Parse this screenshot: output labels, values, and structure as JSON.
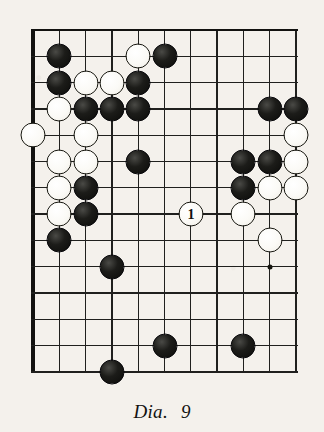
{
  "figure": {
    "caption_label": "Dia.",
    "caption_number": "9",
    "kind": "go-board-diagram"
  },
  "board": {
    "columns": 11,
    "rows": 14,
    "origin_x": 33,
    "origin_y": 30,
    "spacing": 26.3,
    "edge_left": true,
    "edge_top": true,
    "line_color": "#20201e",
    "border_color": "#121210",
    "background": "#f4f1ec",
    "star_points": [
      {
        "col": 9,
        "row": 9,
        "name": "hoshi"
      }
    ]
  },
  "stones": [
    {
      "col": 1,
      "row": 1,
      "color": "black",
      "label": ""
    },
    {
      "col": 4,
      "row": 1,
      "color": "white",
      "label": ""
    },
    {
      "col": 5,
      "row": 1,
      "color": "black",
      "label": ""
    },
    {
      "col": 1,
      "row": 2,
      "color": "black",
      "label": ""
    },
    {
      "col": 2,
      "row": 2,
      "color": "white",
      "label": ""
    },
    {
      "col": 3,
      "row": 2,
      "color": "white",
      "label": ""
    },
    {
      "col": 4,
      "row": 2,
      "color": "black",
      "label": ""
    },
    {
      "col": 1,
      "row": 3,
      "color": "white",
      "label": ""
    },
    {
      "col": 2,
      "row": 3,
      "color": "black",
      "label": ""
    },
    {
      "col": 3,
      "row": 3,
      "color": "black",
      "label": ""
    },
    {
      "col": 4,
      "row": 3,
      "color": "black",
      "label": ""
    },
    {
      "col": 9,
      "row": 3,
      "color": "black",
      "label": ""
    },
    {
      "col": 10,
      "row": 3,
      "color": "black",
      "label": ""
    },
    {
      "col": 0,
      "row": 4,
      "color": "white",
      "label": ""
    },
    {
      "col": 2,
      "row": 4,
      "color": "white",
      "label": ""
    },
    {
      "col": 10,
      "row": 4,
      "color": "white",
      "label": ""
    },
    {
      "col": 1,
      "row": 5,
      "color": "white",
      "label": ""
    },
    {
      "col": 2,
      "row": 5,
      "color": "white",
      "label": ""
    },
    {
      "col": 4,
      "row": 5,
      "color": "black",
      "label": ""
    },
    {
      "col": 8,
      "row": 5,
      "color": "black",
      "label": ""
    },
    {
      "col": 9,
      "row": 5,
      "color": "black",
      "label": ""
    },
    {
      "col": 10,
      "row": 5,
      "color": "white",
      "label": ""
    },
    {
      "col": 1,
      "row": 6,
      "color": "white",
      "label": ""
    },
    {
      "col": 2,
      "row": 6,
      "color": "black",
      "label": ""
    },
    {
      "col": 8,
      "row": 6,
      "color": "black",
      "label": ""
    },
    {
      "col": 9,
      "row": 6,
      "color": "white",
      "label": ""
    },
    {
      "col": 10,
      "row": 6,
      "color": "white",
      "label": ""
    },
    {
      "col": 1,
      "row": 7,
      "color": "white",
      "label": ""
    },
    {
      "col": 2,
      "row": 7,
      "color": "black",
      "label": ""
    },
    {
      "col": 6,
      "row": 7,
      "color": "white",
      "label": "1"
    },
    {
      "col": 8,
      "row": 7,
      "color": "white",
      "label": ""
    },
    {
      "col": 1,
      "row": 8,
      "color": "black",
      "label": ""
    },
    {
      "col": 9,
      "row": 8,
      "color": "white",
      "label": ""
    },
    {
      "col": 3,
      "row": 9,
      "color": "black",
      "label": ""
    },
    {
      "col": 5,
      "row": 12,
      "color": "black",
      "label": ""
    },
    {
      "col": 8,
      "row": 12,
      "color": "black",
      "label": ""
    },
    {
      "col": 3,
      "row": 13,
      "color": "black",
      "label": ""
    }
  ]
}
